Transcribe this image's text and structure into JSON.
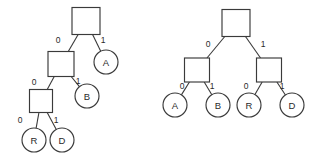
{
  "figure": {
    "title": "",
    "background_color": "#ffffff",
    "stroke_color": "#3a3a3a",
    "text_color": "#2a2a2a",
    "width": 315,
    "height": 166
  },
  "diagram_data": {
    "type": "diagram",
    "subtype": "binary-decision-trees",
    "description": "Two binary trees with square internal nodes and circular leaf nodes labeled A, B, R, D; every edge labeled 0 or 1",
    "edge_labels": [
      "0",
      "1"
    ],
    "leaf_labels": [
      "A",
      "B",
      "R",
      "D"
    ],
    "trees": [
      {
        "name": "left-tree",
        "shape": "unbalanced",
        "depth": 4,
        "codes": {
          "A": "1",
          "B": "01",
          "D": "001",
          "R": "000"
        },
        "nodes": [
          {
            "id": "L-root",
            "kind": "square",
            "label": "",
            "cx": 86,
            "cy": 21,
            "w": 28,
            "h": 27
          },
          {
            "id": "L-n1",
            "kind": "square",
            "label": "",
            "cx": 61,
            "cy": 64,
            "w": 26,
            "h": 25
          },
          {
            "id": "L-n2",
            "kind": "square",
            "label": "",
            "cx": 41,
            "cy": 101,
            "w": 23,
            "h": 23
          },
          {
            "id": "L-leafA",
            "kind": "circle",
            "label": "A",
            "cx": 106,
            "cy": 62,
            "r": 12
          },
          {
            "id": "L-leafB",
            "kind": "circle",
            "label": "B",
            "cx": 87,
            "cy": 96,
            "r": 12
          },
          {
            "id": "L-leafR",
            "kind": "circle",
            "label": "R",
            "cx": 34,
            "cy": 140,
            "r": 12
          },
          {
            "id": "L-leafD",
            "kind": "circle",
            "label": "D",
            "cx": 62,
            "cy": 140,
            "r": 12
          }
        ],
        "edges": [
          {
            "from": "L-root",
            "to": "L-n1",
            "label": "0",
            "lx": 58,
            "ly": 40
          },
          {
            "from": "L-root",
            "to": "L-leafA",
            "label": "1",
            "lx": 103,
            "ly": 40
          },
          {
            "from": "L-n1",
            "to": "L-n2",
            "label": "0",
            "lx": 34,
            "ly": 82
          },
          {
            "from": "L-n1",
            "to": "L-leafB",
            "label": "1",
            "lx": 78,
            "ly": 81
          },
          {
            "from": "L-n2",
            "to": "L-leafR",
            "label": "0",
            "lx": 20,
            "ly": 120
          },
          {
            "from": "L-n2",
            "to": "L-leafD",
            "label": "1",
            "lx": 56,
            "ly": 120
          }
        ]
      },
      {
        "name": "right-tree",
        "shape": "balanced",
        "depth": 3,
        "codes": {
          "A": "00",
          "B": "01",
          "R": "10",
          "D": "11"
        },
        "nodes": [
          {
            "id": "R-root",
            "kind": "square",
            "label": "",
            "cx": 236,
            "cy": 23,
            "w": 28,
            "h": 27
          },
          {
            "id": "R-n1",
            "kind": "square",
            "label": "",
            "cx": 197,
            "cy": 70,
            "w": 25,
            "h": 24
          },
          {
            "id": "R-n2",
            "kind": "square",
            "label": "",
            "cx": 269,
            "cy": 70,
            "w": 25,
            "h": 24
          },
          {
            "id": "R-leafA",
            "kind": "circle",
            "label": "A",
            "cx": 175,
            "cy": 105,
            "r": 12
          },
          {
            "id": "R-leafB",
            "kind": "circle",
            "label": "B",
            "cx": 218,
            "cy": 105,
            "r": 12
          },
          {
            "id": "R-leafR",
            "kind": "circle",
            "label": "R",
            "cx": 249,
            "cy": 105,
            "r": 12
          },
          {
            "id": "R-leafD",
            "kind": "circle",
            "label": "D",
            "cx": 292,
            "cy": 105,
            "r": 12
          }
        ],
        "edges": [
          {
            "from": "R-root",
            "to": "R-n1",
            "label": "0",
            "lx": 208,
            "ly": 44
          },
          {
            "from": "R-root",
            "to": "R-n2",
            "label": "1",
            "lx": 263,
            "ly": 44
          },
          {
            "from": "R-n1",
            "to": "R-leafA",
            "label": "0",
            "lx": 182,
            "ly": 86
          },
          {
            "from": "R-n1",
            "to": "R-leafB",
            "label": "1",
            "lx": 212,
            "ly": 86
          },
          {
            "from": "R-n2",
            "to": "R-leafR",
            "label": "0",
            "lx": 246,
            "ly": 86
          },
          {
            "from": "R-n2",
            "to": "R-leafD",
            "label": "1",
            "lx": 282,
            "ly": 86
          }
        ]
      }
    ]
  }
}
